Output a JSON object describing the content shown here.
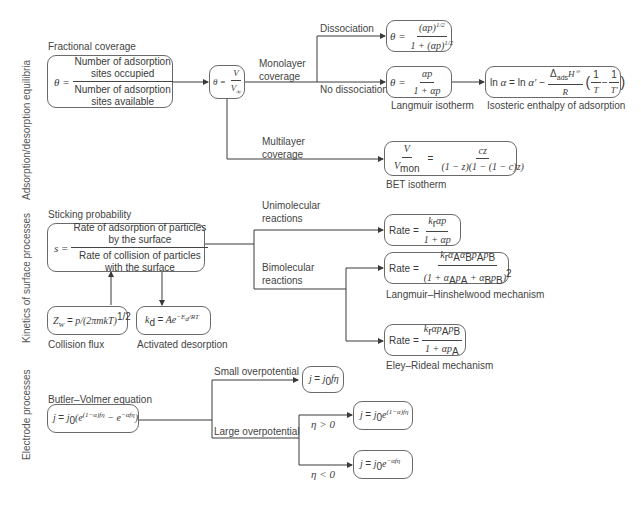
{
  "sections": {
    "adsorption": "Adsorption/desorption equilibria",
    "kinetics": "Kinetics of surface processes",
    "electrode": "Electrode processes"
  },
  "adsorption": {
    "fractional_coverage_title": "Fractional coverage",
    "theta_lhs": "θ =",
    "numerator_line1": "Number of adsorption",
    "numerator_line2": "sites occupied",
    "denominator_line1": "Number of adsorption",
    "denominator_line2": "sites available",
    "theta_v": {
      "lhs": "θ =",
      "num": "V",
      "den": "V∞"
    },
    "monolayer_label_1": "Monolayer",
    "monolayer_label_2": "coverage",
    "dissociation_label": "Dissociation",
    "no_dissociation_label": "No dissociation",
    "multilayer_label_1": "Multilayer",
    "multilayer_label_2": "coverage",
    "dissociation_eq": {
      "lhs": "θ =",
      "num": "(αp)^1/2",
      "den": "1 + (αp)^1/2"
    },
    "langmuir_eq": {
      "lhs": "θ =",
      "num": "αp",
      "den": "1 + αp"
    },
    "langmuir_caption": "Langmuir isotherm",
    "isosteric_eq": "ln α = ln α' − (ΔadsH°/R)(1/T − 1/T')",
    "isosteric_caption": "Isosteric enthalpy of adsorption",
    "bet_eq": {
      "lhs_num": "V",
      "lhs_den": "Vmon",
      "num": "cz",
      "den": "(1 − z)(1 − (1 − c)z)"
    },
    "bet_caption": "BET isotherm"
  },
  "kinetics": {
    "sticking_title": "Sticking probability",
    "s_lhs": "s =",
    "num_line1": "Rate of adsorption of particles",
    "num_line2": "by the surface",
    "den_line1": "Rate of collision of particles",
    "den_line2": "with the surface",
    "collision_eq": "ZW = p/(2πmkT)^1/2",
    "collision_caption": "Collision flux",
    "desorption_eq": "kd = Ae^(−Ed/RT)",
    "desorption_caption": "Activated desorption",
    "unimolecular_1": "Unimolecular",
    "unimolecular_2": "reactions",
    "bimolecular_1": "Bimolecular",
    "bimolecular_2": "reactions",
    "rate_label": "Rate =",
    "uni_eq": {
      "num": "krαp",
      "den": "1 + αp"
    },
    "lh_eq": {
      "num": "krαAαBpApB",
      "den": "(1 + αApA + αBpB)^2"
    },
    "lh_caption": "Langmuir–Hinshelwood mechanism",
    "er_eq": {
      "num": "krαpApB",
      "den": "1 + αpA"
    },
    "er_caption": "Eley–Rideal mechanism"
  },
  "electrode": {
    "bv_title": "Butler–Volmer equation",
    "bv_eq": "j = j0(e^((1−α)fη) − e^(−αfη))",
    "small_label": "Small overpotential",
    "small_eq": "j = j0fη",
    "large_label": "Large overpotential",
    "pos_label": "η > 0",
    "pos_eq": "j = j0e^((1−α)fη)",
    "neg_label": "η < 0",
    "neg_eq": "j = j0e^(−αfη)"
  },
  "colors": {
    "line": "#3a3a3a",
    "box_border": "#6a6a6a",
    "text": "#3a3a3a",
    "section_text": "#555555"
  }
}
